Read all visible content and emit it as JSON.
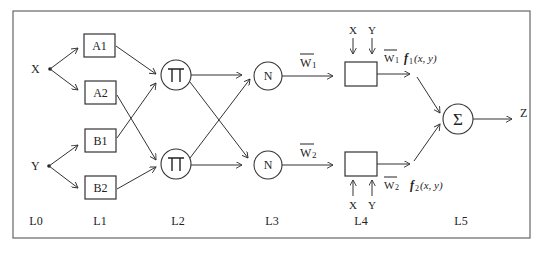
{
  "diagram": {
    "type": "ANFIS architecture",
    "inputs": [
      {
        "id": "X",
        "label": "X"
      },
      {
        "id": "Y",
        "label": "Y"
      }
    ],
    "layers": [
      {
        "id": "L0",
        "label": "L0"
      },
      {
        "id": "L1",
        "label": "L1"
      },
      {
        "id": "L2",
        "label": "L2"
      },
      {
        "id": "L3",
        "label": "L3"
      },
      {
        "id": "L4",
        "label": "L4"
      },
      {
        "id": "L5",
        "label": "L5"
      }
    ],
    "membership_nodes": [
      {
        "id": "A1",
        "label": "A1"
      },
      {
        "id": "A2",
        "label": "A2"
      },
      {
        "id": "B1",
        "label": "B1"
      },
      {
        "id": "B2",
        "label": "B2"
      }
    ],
    "product_nodes": [
      {
        "id": "P1",
        "label": "∏"
      },
      {
        "id": "P2",
        "label": "∏"
      }
    ],
    "normalization_nodes": [
      {
        "id": "N1",
        "label": "N"
      },
      {
        "id": "N2",
        "label": "N"
      }
    ],
    "weights": [
      {
        "id": "w1",
        "label": "W",
        "sub": "1"
      },
      {
        "id": "w2",
        "label": "W",
        "sub": "2"
      }
    ],
    "consequent_inputs": {
      "top": [
        "X",
        "Y"
      ],
      "bottom": [
        "X",
        "Y"
      ]
    },
    "consequent_outputs": [
      {
        "id": "o1",
        "w": "W",
        "wsub": "1",
        "f": "f",
        "fsub": "1",
        "args": "(x, y)"
      },
      {
        "id": "o2",
        "w": "W",
        "wsub": "2",
        "f": "f",
        "fsub": "2",
        "args": "(x, y)"
      }
    ],
    "sum_node": {
      "label": "Σ"
    },
    "output": {
      "label": "Z"
    },
    "edges": [
      [
        "X",
        "A1"
      ],
      [
        "X",
        "A2"
      ],
      [
        "Y",
        "B1"
      ],
      [
        "Y",
        "B2"
      ],
      [
        "A1",
        "P1"
      ],
      [
        "A2",
        "P2"
      ],
      [
        "B1",
        "P1"
      ],
      [
        "B2",
        "P2"
      ],
      [
        "P1",
        "N1"
      ],
      [
        "P1",
        "N2"
      ],
      [
        "P2",
        "N1"
      ],
      [
        "P2",
        "N2"
      ],
      [
        "N1",
        "R1"
      ],
      [
        "N2",
        "R2"
      ],
      [
        "R1",
        "S"
      ],
      [
        "R2",
        "S"
      ],
      [
        "S",
        "Z"
      ]
    ]
  }
}
